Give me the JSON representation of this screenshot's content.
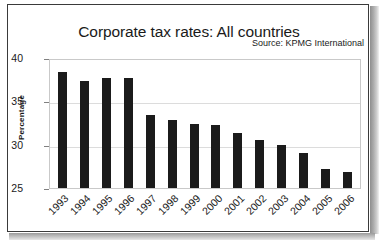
{
  "figure": {
    "title": "Corporate tax rates: All countries",
    "source_note": "Source: KPMG International"
  },
  "chart_data": {
    "type": "bar",
    "title": "Corporate tax rates: All countries",
    "xlabel": "",
    "ylabel": "Percentage",
    "ylim": [
      25,
      40
    ],
    "yticks": [
      25,
      30,
      35,
      40
    ],
    "grid": true,
    "legend": "none",
    "annotations": [
      "Source: KPMG International"
    ],
    "bar_color": "#1b1b1b",
    "categories": [
      "1993",
      "1994",
      "1995",
      "1996",
      "1997",
      "1998",
      "1999",
      "2000",
      "2001",
      "2002",
      "2003",
      "2004",
      "2005",
      "2006"
    ],
    "values": [
      38.4,
      37.3,
      37.7,
      37.7,
      33.4,
      32.9,
      32.4,
      32.3,
      31.3,
      30.5,
      30.0,
      29.0,
      27.2,
      26.8
    ]
  }
}
